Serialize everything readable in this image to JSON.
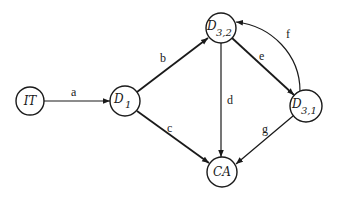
{
  "diagram": {
    "type": "directed-graph",
    "nodes": [
      {
        "id": "IT",
        "label": "IT",
        "sub": ""
      },
      {
        "id": "D1",
        "label": "D",
        "sub": "1"
      },
      {
        "id": "D32",
        "label": "D",
        "sub": "3,2"
      },
      {
        "id": "D31",
        "label": "D",
        "sub": "3,1"
      },
      {
        "id": "CA",
        "label": "CA",
        "sub": ""
      }
    ],
    "edges": [
      {
        "label": "a",
        "from": "IT",
        "to": "D1"
      },
      {
        "label": "b",
        "from": "D1",
        "to": "D32"
      },
      {
        "label": "c",
        "from": "D1",
        "to": "CA"
      },
      {
        "label": "d",
        "from": "D32",
        "to": "CA"
      },
      {
        "label": "e",
        "from": "D32",
        "to": "D31"
      },
      {
        "label": "f",
        "from": "D31",
        "to": "D32"
      },
      {
        "label": "g",
        "from": "D31",
        "to": "CA"
      }
    ]
  }
}
